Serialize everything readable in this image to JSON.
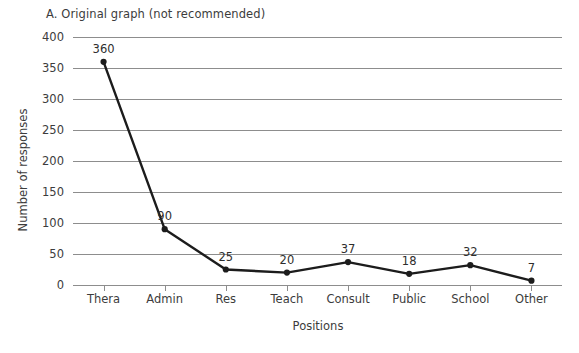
{
  "chart_data": {
    "type": "line",
    "title": "A. Original graph (not recommended)",
    "xlabel": "Positions",
    "ylabel": "Number of responses",
    "categories": [
      "Thera",
      "Admin",
      "Res",
      "Teach",
      "Consult",
      "Public",
      "School",
      "Other"
    ],
    "values": [
      360,
      90,
      25,
      20,
      37,
      18,
      32,
      7
    ],
    "data_labels": [
      "360",
      "90",
      "25",
      "20",
      "37",
      "18",
      "32",
      "7"
    ],
    "ylim": [
      0,
      400
    ],
    "ytick_labels": [
      "0",
      "50",
      "100",
      "150",
      "200",
      "250",
      "300",
      "350",
      "400"
    ],
    "ytick_values": [
      0,
      50,
      100,
      150,
      200,
      250,
      300,
      350,
      400
    ],
    "grid": true,
    "legend": "none",
    "colors": {
      "line": "#1c1c1c",
      "marker": "#1c1c1c",
      "grid": "#8d8d8d",
      "text": "#3c3c3c",
      "background": "#ffffff"
    }
  }
}
